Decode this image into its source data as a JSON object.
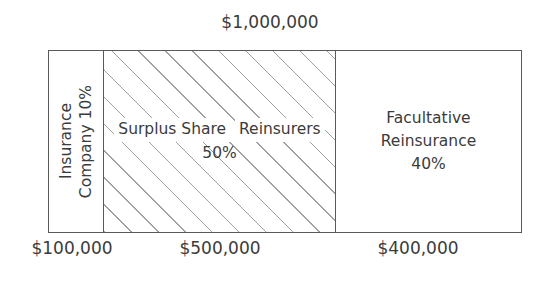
{
  "diagram": {
    "type": "stacked-horizontal-bar",
    "title_top": "$1,000,000",
    "total_value": 1000000,
    "segments": [
      {
        "id": "insurance-company",
        "label_line1": "Insurance",
        "label_line2": "Company 10%",
        "percent": "10%",
        "percent_value": 10,
        "amount_label": "$100,000",
        "amount_value": 100000,
        "fill": "solid-white",
        "orientation": "vertical-text"
      },
      {
        "id": "surplus-share-reinsurers",
        "label_line1": "Surplus Share",
        "label_line2": "Reinsurers",
        "label_line3": "50%",
        "percent": "50%",
        "percent_value": 50,
        "amount_label": "$500,000",
        "amount_value": 500000,
        "fill": "diagonal-hatch",
        "orientation": "horizontal-text"
      },
      {
        "id": "facultative-reinsurance",
        "label_line1": "Facultative",
        "label_line2": "Reinsurance",
        "label_line3": "40%",
        "percent": "40%",
        "percent_value": 40,
        "amount_label": "$400,000",
        "amount_value": 400000,
        "fill": "solid-white",
        "orientation": "horizontal-text"
      }
    ]
  },
  "colors": {
    "background": "#ffffff",
    "outline": "#5a5a5a",
    "text": "#3b3b3b",
    "hatch": "#a0a0a0"
  },
  "chart_data": {
    "type": "bar",
    "title": "$1,000,000",
    "orientation": "horizontal-stacked",
    "categories": [
      "Insurance Company 10%",
      "Surplus Share Reinsurers 50%",
      "Facultative Reinsurance 40%"
    ],
    "values": [
      100000,
      500000,
      400000
    ],
    "percent_values": [
      10,
      50,
      40
    ],
    "tick_labels": [
      "$100,000",
      "$500,000",
      "$400,000"
    ],
    "xlabel": "",
    "ylabel": "",
    "xlim": [
      0,
      1000000
    ],
    "grid": false,
    "legend": "none",
    "annotations": [
      "$1,000,000"
    ]
  }
}
